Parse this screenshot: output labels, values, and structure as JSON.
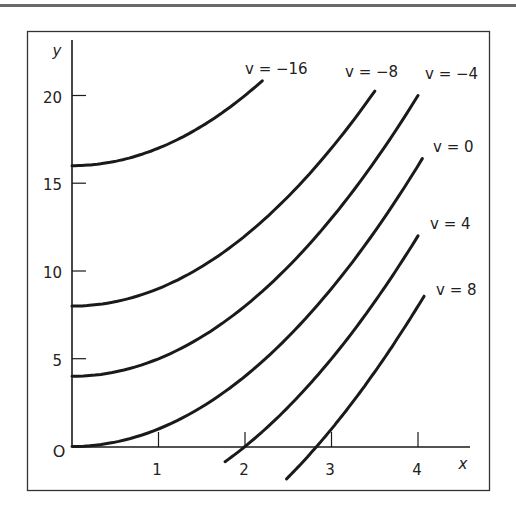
{
  "chart_data": {
    "type": "line",
    "title": "",
    "xlabel": "x",
    "ylabel": "y",
    "origin_label": "O",
    "xlim": [
      0,
      4.5
    ],
    "ylim": [
      0,
      21
    ],
    "x_ticks": [
      1,
      2,
      3,
      4
    ],
    "x_tick_labels": [
      "1",
      "2",
      "3",
      "4"
    ],
    "y_ticks": [
      5,
      10,
      15,
      20
    ],
    "y_tick_labels": [
      "5",
      "10",
      "15",
      "20"
    ],
    "grid": false,
    "legend": "inline labels at curve ends",
    "relation": "y = x^2 - v",
    "series": [
      {
        "name": "v = −16",
        "v": -16,
        "x_range": [
          0,
          2.2
        ],
        "x": [
          0,
          0.5,
          1,
          1.5,
          2,
          2.2
        ],
        "y": [
          16,
          16.25,
          17,
          18.25,
          20,
          20.84
        ]
      },
      {
        "name": "v = −8",
        "v": -8,
        "x_range": [
          0,
          3.5
        ],
        "x": [
          0,
          1,
          2,
          3,
          3.5
        ],
        "y": [
          8,
          9,
          12,
          17,
          20.25
        ]
      },
      {
        "name": "v = −4",
        "v": -4,
        "x_range": [
          0,
          4.0
        ],
        "x": [
          0,
          1,
          2,
          3,
          4
        ],
        "y": [
          4,
          5,
          8,
          13,
          20
        ]
      },
      {
        "name": "v = 0",
        "v": 0,
        "x_range": [
          0,
          4.05
        ],
        "x": [
          0,
          1,
          2,
          3,
          4.05
        ],
        "y": [
          0,
          1,
          4,
          9,
          16.4
        ]
      },
      {
        "name": "v = 4",
        "v": 4,
        "x_range": [
          1.77,
          4.0
        ],
        "x": [
          1.77,
          2,
          3,
          4
        ],
        "y": [
          -0.87,
          0,
          5,
          12
        ]
      },
      {
        "name": "v = 8",
        "v": 8,
        "x_range": [
          2.48,
          4.07
        ],
        "x": [
          2.48,
          2.83,
          3.5,
          4.07
        ],
        "y": [
          -1.85,
          0,
          4.25,
          8.56
        ]
      }
    ]
  },
  "labels": {
    "v_m16": "v = −16",
    "v_m8": "v = −8",
    "v_m4": "v = −4",
    "v_0": "v = 0",
    "v_4": "v = 4",
    "v_8": "v = 8",
    "x_axis": "x",
    "y_axis": "y",
    "origin": "O",
    "xt1": "1",
    "xt2": "2",
    "xt3": "3",
    "xt4": "4",
    "yt5": "5",
    "yt10": "10",
    "yt15": "15",
    "yt20": "20"
  },
  "colors": {
    "ink": "#1a1a1a",
    "frame": "#333333",
    "rule": "#6a6a6a"
  }
}
